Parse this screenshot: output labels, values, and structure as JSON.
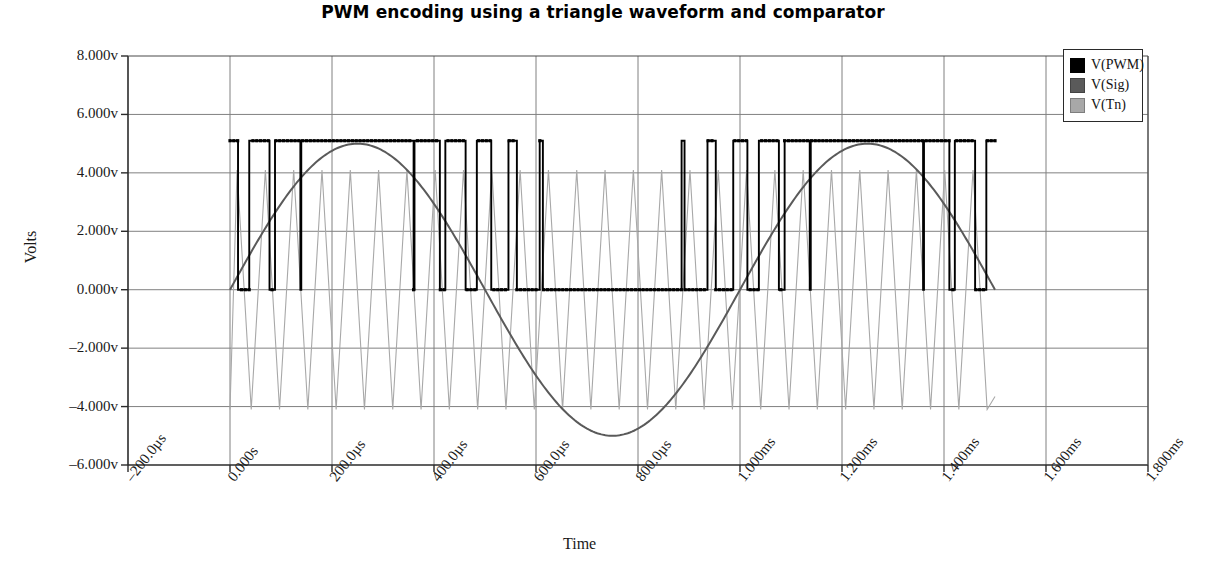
{
  "title": "PWM encoding using a triangle waveform and comparator",
  "axes": {
    "xlabel": "Time",
    "ylabel": "Volts"
  },
  "legend": {
    "position": "top-right",
    "items": [
      {
        "label": "V(PWM)",
        "color": "#000000"
      },
      {
        "label": "V(Sig)",
        "color": "#5a5a5a"
      },
      {
        "label": "V(Tn)",
        "color": "#a8a8a8"
      }
    ]
  },
  "chart_data": {
    "type": "line",
    "title": "PWM encoding using a triangle waveform and comparator",
    "xlabel": "Time",
    "ylabel": "Volts",
    "grid": true,
    "legend_position": "top-right",
    "xlim_us": [
      -200,
      1800
    ],
    "ylim_v": [
      -6,
      8
    ],
    "x_tick_labels": [
      "-200.0µs",
      "0.000s",
      "200.0µs",
      "400.0µs",
      "600.0µs",
      "800.0µs",
      "1.000ms",
      "1.200ms",
      "1.400ms",
      "1.600ms",
      "1.800ms"
    ],
    "x_tick_values_us": [
      -200,
      0,
      200,
      400,
      600,
      800,
      1000,
      1200,
      1400,
      1600,
      1800
    ],
    "y_tick_labels": [
      "8.000v",
      "6.000v",
      "4.000v",
      "2.000v",
      "0.000v",
      "-2.000v",
      "-4.000v",
      "-6.000v"
    ],
    "y_tick_values_v": [
      8,
      6,
      4,
      2,
      0,
      -2,
      -4,
      -6
    ],
    "signal_span_us": [
      0,
      1500
    ],
    "series": [
      {
        "name": "V(PWM)",
        "color": "#000000",
        "kind": "square-pwm",
        "marker": "square-dot",
        "low_v": 0.0,
        "high_v": 5.1,
        "carrier_period_us": 55.5,
        "description": "Comparator output: high while V(Sig) > V(Tn)"
      },
      {
        "name": "V(Sig)",
        "color": "#5a5a5a",
        "kind": "sine",
        "amplitude_v": 5.0,
        "offset_v": 0.0,
        "period_us": 1000,
        "phase_deg": 0,
        "description": "Modulating sine wave, 1 kHz, 5 V peak"
      },
      {
        "name": "V(Tn)",
        "color": "#a8a8a8",
        "kind": "triangle",
        "amplitude_v": 4.1,
        "offset_v": 0.0,
        "period_us": 55.5,
        "description": "Triangle carrier waveform, approx 18 kHz, 4 V peak"
      }
    ]
  }
}
